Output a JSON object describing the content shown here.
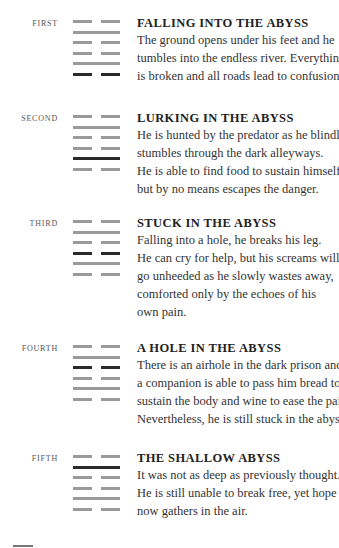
{
  "colors": {
    "line": "#9a9a9a",
    "moving_line": "#2a2a2a",
    "text": "#333333"
  },
  "entries": [
    {
      "label": "FIRST",
      "title": "FALLING INTO THE ABYSS",
      "lines": [
        "broken",
        "solid",
        "broken",
        "broken",
        "solid",
        "broken"
      ],
      "moving_index": 5,
      "body": [
        "The ground opens under his feet and he",
        "tumbles into the endless river. Everything",
        "is broken and all roads lead to confusion."
      ]
    },
    {
      "label": "SECOND",
      "title": "LURKING IN THE ABYSS",
      "lines": [
        "broken",
        "solid",
        "broken",
        "broken",
        "solid",
        "broken"
      ],
      "moving_index": 4,
      "body": [
        "He is hunted by the predator as he blindly",
        "stumbles through the dark alleyways.",
        "He is able to find food to sustain himself,",
        "but by no means escapes the danger."
      ]
    },
    {
      "label": "THIRD",
      "title": "STUCK IN THE ABYSS",
      "lines": [
        "broken",
        "solid",
        "broken",
        "broken",
        "solid",
        "broken"
      ],
      "moving_index": 3,
      "body": [
        "Falling into a hole, he breaks his leg.",
        "He can cry for help, but his screams will",
        "go unheeded as he slowly wastes away,",
        "comforted only by the echoes of his",
        "own pain."
      ]
    },
    {
      "label": "FOURTH",
      "title": "A HOLE IN THE ABYSS",
      "lines": [
        "broken",
        "solid",
        "broken",
        "broken",
        "solid",
        "broken"
      ],
      "moving_index": 2,
      "body": [
        "There is an airhole in the dark prison and",
        "a companion is able to pass him bread to",
        "sustain the body and wine to ease the pain.",
        "Nevertheless, he is still stuck in the abyss."
      ]
    },
    {
      "label": "FIFTH",
      "title": "THE SHALLOW ABYSS",
      "lines": [
        "broken",
        "solid",
        "broken",
        "broken",
        "solid",
        "broken"
      ],
      "moving_index": 1,
      "body": [
        "It was not as deep as previously thought.",
        "He is still unable to break free, yet hope",
        "now gathers in the air."
      ]
    }
  ]
}
